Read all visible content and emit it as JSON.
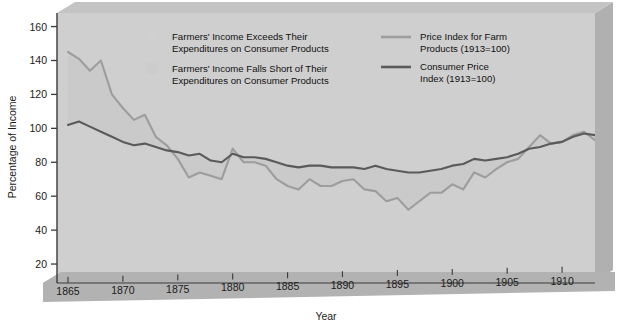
{
  "chart_data": {
    "type": "line",
    "title": "",
    "subtitle": "",
    "xlabel": "Year",
    "ylabel": "Percentage of Income",
    "xlim": [
      1864,
      1913
    ],
    "ylim": [
      10,
      168
    ],
    "xticks": [
      1865,
      1870,
      1875,
      1880,
      1885,
      1890,
      1895,
      1900,
      1905,
      1910
    ],
    "yticks": [
      20,
      40,
      60,
      80,
      100,
      120,
      140,
      160
    ],
    "grid": false,
    "legend_position": "top-inside",
    "x": [
      1865,
      1866,
      1867,
      1868,
      1869,
      1870,
      1871,
      1872,
      1873,
      1874,
      1875,
      1876,
      1877,
      1878,
      1879,
      1880,
      1881,
      1882,
      1883,
      1884,
      1885,
      1886,
      1887,
      1888,
      1889,
      1890,
      1891,
      1892,
      1893,
      1894,
      1895,
      1896,
      1897,
      1898,
      1899,
      1900,
      1901,
      1902,
      1903,
      1904,
      1905,
      1906,
      1907,
      1908,
      1909,
      1910,
      1911,
      1912,
      1913
    ],
    "series": [
      {
        "name": "Price Index for Farm Products (1913=100)",
        "color": "#9d9d9d",
        "values": [
          145,
          141,
          134,
          140,
          120,
          112,
          105,
          108,
          95,
          90,
          82,
          71,
          74,
          72,
          70,
          88,
          80,
          80,
          78,
          70,
          66,
          64,
          70,
          66,
          66,
          69,
          70,
          64,
          63,
          57,
          59,
          52,
          57,
          62,
          62,
          67,
          64,
          74,
          71,
          76,
          80,
          82,
          89,
          96,
          91,
          92,
          96,
          98,
          93
        ]
      },
      {
        "name": "Consumer Price Index (1913=100)",
        "color": "#5a5a5a",
        "values": [
          102,
          104,
          101,
          98,
          95,
          92,
          90,
          91,
          89,
          87,
          86,
          84,
          85,
          81,
          80,
          85,
          83,
          83,
          82,
          80,
          78,
          77,
          78,
          78,
          77,
          77,
          77,
          76,
          78,
          76,
          75,
          74,
          74,
          75,
          76,
          78,
          79,
          82,
          81,
          82,
          83,
          85,
          88,
          89,
          91,
          92,
          95,
          97,
          96
        ]
      }
    ],
    "legend_left": [
      {
        "swatch": "shaded-area-above",
        "color": "#d2d2d2",
        "lines": [
          "Farmers' Income Exceeds Their",
          "Expenditures on Consumer Products"
        ]
      },
      {
        "swatch": "shaded-area-below",
        "color": "#cbcbcb",
        "lines": [
          "Farmers' Income Falls Short of Their",
          "Expenditures on Consumer Products"
        ]
      }
    ],
    "legend_right": [
      {
        "swatch": "line",
        "color": "#9d9d9d",
        "lines": [
          "Price Index for Farm",
          "Products (1913=100)"
        ]
      },
      {
        "swatch": "line",
        "color": "#5a5a5a",
        "lines": [
          "Consumer Price",
          "Index  (1913=100)"
        ]
      }
    ],
    "colors": {
      "plot_face": "#cfcfcf",
      "plot_side": "#b0b0b0",
      "floor_band": "#b4b4b4",
      "axis": "#3a3a3a",
      "background": "#ffffff"
    }
  }
}
